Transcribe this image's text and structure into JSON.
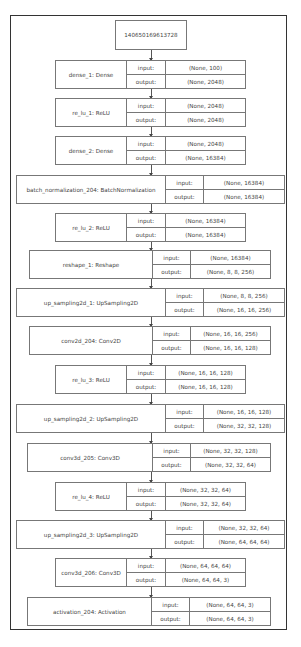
{
  "diagram": {
    "root": {
      "label": "140650169613728"
    },
    "io_labels": {
      "input": "input:",
      "output": "output:"
    },
    "layers": [
      {
        "name": "dense_1: Dense",
        "input": "(None, 100)",
        "output": "(None, 2048)",
        "x": 55,
        "y": 60,
        "w": 191,
        "name_w": 71,
        "io_w": 39
      },
      {
        "name": "re_lu_1: ReLU",
        "input": "(None, 2048)",
        "output": "(None, 2048)",
        "x": 55,
        "y": 98,
        "w": 191,
        "name_w": 71,
        "io_w": 39
      },
      {
        "name": "dense_2: Dense",
        "input": "(None, 2048)",
        "output": "(None, 16384)",
        "x": 55,
        "y": 136,
        "w": 191,
        "name_w": 71,
        "io_w": 39
      },
      {
        "name": "batch_normalization_204: BatchNormalization",
        "input": "(None, 16384)",
        "output": "(None, 16384)",
        "x": 16,
        "y": 175,
        "w": 269,
        "name_w": 149,
        "io_w": 38
      },
      {
        "name": "re_lu_2: ReLU",
        "input": "(None, 16384)",
        "output": "(None, 16384)",
        "x": 55,
        "y": 213,
        "w": 191,
        "name_w": 71,
        "io_w": 39
      },
      {
        "name": "reshape_1: Reshape",
        "input": "(None, 16384)",
        "output": "(None, 8, 8, 256)",
        "x": 29,
        "y": 250,
        "w": 242,
        "name_w": 123,
        "io_w": 38
      },
      {
        "name": "up_sampling2d_1: UpSampling2D",
        "input": "(None, 8, 8, 256)",
        "output": "(None, 16, 16, 256)",
        "x": 16,
        "y": 288,
        "w": 269,
        "name_w": 149,
        "io_w": 38
      },
      {
        "name": "conv2d_204: Conv2D",
        "input": "(None, 16, 16, 256)",
        "output": "(None, 16, 16, 128)",
        "x": 29,
        "y": 326,
        "w": 242,
        "name_w": 123,
        "io_w": 38
      },
      {
        "name": "re_lu_3: ReLU",
        "input": "(None, 16, 16, 128)",
        "output": "(None, 16, 16, 128)",
        "x": 55,
        "y": 365,
        "w": 191,
        "name_w": 71,
        "io_w": 39
      },
      {
        "name": "up_sampling2d_2: UpSampling2D",
        "input": "(None, 16, 16, 128)",
        "output": "(None, 32, 32, 128)",
        "x": 16,
        "y": 404,
        "w": 269,
        "name_w": 149,
        "io_w": 38
      },
      {
        "name": "conv3d_205: Conv3D",
        "input": "(None, 32, 32, 128)",
        "output": "(None, 32, 32, 64)",
        "x": 27,
        "y": 443,
        "w": 244,
        "name_w": 125,
        "io_w": 38
      },
      {
        "name": "re_lu_4: ReLU",
        "input": "(None, 32, 32, 64)",
        "output": "(None, 32, 32, 64)",
        "x": 55,
        "y": 482,
        "w": 191,
        "name_w": 71,
        "io_w": 39
      },
      {
        "name": "up_sampling2d_3: UpSampling2D",
        "input": "(None, 32, 32, 64)",
        "output": "(None, 64, 64, 64)",
        "x": 16,
        "y": 520,
        "w": 269,
        "name_w": 149,
        "io_w": 38
      },
      {
        "name": "conv3d_206: Conv3D",
        "input": "(None, 64, 64, 64)",
        "output": "(None, 64, 64, 3)",
        "x": 55,
        "y": 558,
        "w": 191,
        "name_w": 71,
        "io_w": 39
      },
      {
        "name": "activation_204: Activation",
        "input": "(None, 64, 64, 3)",
        "output": "(None, 64, 64, 3)",
        "x": 27,
        "y": 597,
        "w": 244,
        "name_w": 124,
        "io_w": 38
      }
    ]
  }
}
